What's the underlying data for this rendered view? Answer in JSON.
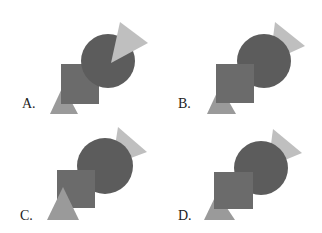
{
  "colors": {
    "circle": "#5c5c5c",
    "square": "#6b6b6b",
    "light_triangle": "#bfbfbf",
    "small_triangle": "#9a9a9a",
    "label": "#222222"
  },
  "options": [
    {
      "label": "A.",
      "label_pos": [
        22,
        108
      ],
      "layers": [
        "light_triangle_bottom",
        "square",
        "circle",
        "light_triangle_top"
      ],
      "circle": {
        "cx": 108,
        "cy": 61,
        "r": 27
      },
      "square": {
        "x": 61,
        "y": 64,
        "w": 38,
        "h": 40
      },
      "light_triangle": "120,22 148,43 111,63",
      "small_triangle": "63,86 50,114 78,114",
      "light_triangle_in_front_of_circle": true,
      "small_triangle_in_front_of_square": false
    },
    {
      "label": "B.",
      "label_pos": [
        178,
        108
      ],
      "layers": [
        "light_triangle",
        "circle",
        "small_triangle",
        "square"
      ],
      "circle": {
        "cx": 264,
        "cy": 61,
        "r": 27
      },
      "square": {
        "x": 216,
        "y": 64,
        "w": 38,
        "h": 39
      },
      "light_triangle": "275,22 305,46 270,62",
      "small_triangle": "220,86 207,114 236,114",
      "light_triangle_in_front_of_circle": false,
      "small_triangle_in_front_of_square": false
    },
    {
      "label": "C.",
      "label_pos": [
        20,
        220
      ],
      "layers": [
        "light_triangle",
        "circle",
        "square",
        "small_triangle"
      ],
      "circle": {
        "cx": 105,
        "cy": 166,
        "r": 28
      },
      "square": {
        "x": 57,
        "y": 170,
        "w": 38,
        "h": 38
      },
      "light_triangle": "118,127 147,152 112,165",
      "small_triangle": "63,187 47,220 79,220",
      "light_triangle_in_front_of_circle": false,
      "small_triangle_in_front_of_square": true
    },
    {
      "label": "D.",
      "label_pos": [
        178,
        220
      ],
      "layers": [
        "light_triangle",
        "small_triangle",
        "circle",
        "square"
      ],
      "circle": {
        "cx": 261,
        "cy": 168,
        "r": 27
      },
      "square": {
        "x": 214,
        "y": 172,
        "w": 39,
        "h": 37
      },
      "light_triangle": "273,129 302,153 268,167",
      "small_triangle": "217,193 204,220 235,220",
      "light_triangle_in_front_of_circle": false,
      "small_triangle_in_front_of_square": false
    }
  ]
}
